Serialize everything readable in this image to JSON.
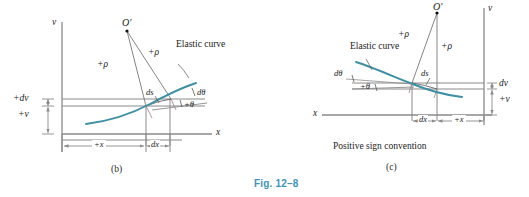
{
  "figure": {
    "caption": "Fig. 12–8",
    "colors": {
      "elastic_curve": "#3e8fa3",
      "axis_line": "#8a8a8a",
      "construction_line": "#777777",
      "caption_color": "#3f93b5",
      "text": "#1a1a1a",
      "background": "#ffffff"
    }
  },
  "panel_b": {
    "letter": "(b)",
    "axis_v": "v",
    "axis_x": "x",
    "origin_point": "O′",
    "radius_label_left": "+ρ",
    "radius_label_right": "+ρ",
    "arc_label": "ds",
    "curve_label": "Elastic curve",
    "angle_increment": "dθ",
    "angle_label": "+θ",
    "dv_label": "+dv",
    "v_label": "+v",
    "x_dim_label": "+x",
    "dx_dim_label": "dx"
  },
  "panel_c": {
    "letter": "(c)",
    "title": "Positive sign convention",
    "axis_v": "v",
    "axis_x": "x",
    "origin_point": "O′",
    "radius_label_left": "+ρ",
    "radius_label_right": "+ρ",
    "arc_label": "ds",
    "curve_label": "Elastic curve",
    "angle_increment": "dθ",
    "angle_label": "+θ",
    "dv_label": "dv",
    "v_label": "+v",
    "x_dim_label": "+x",
    "dx_dim_label": "dx"
  }
}
